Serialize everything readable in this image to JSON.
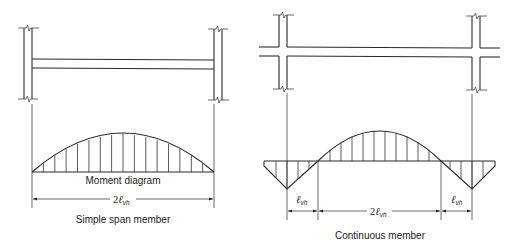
{
  "simple": {
    "diagram_label": "Moment diagram",
    "dimension": {
      "coef": "2",
      "symbol": "ℓ",
      "subscript": "vh"
    },
    "caption": "Simple span member"
  },
  "continuous": {
    "dim_left": {
      "coef": "",
      "symbol": "ℓ",
      "subscript": "vh"
    },
    "dim_center": {
      "coef": "2",
      "symbol": "ℓ",
      "subscript": "vh"
    },
    "dim_right": {
      "coef": "",
      "symbol": "ℓ",
      "subscript": "vh"
    },
    "caption": "Continuous member"
  }
}
